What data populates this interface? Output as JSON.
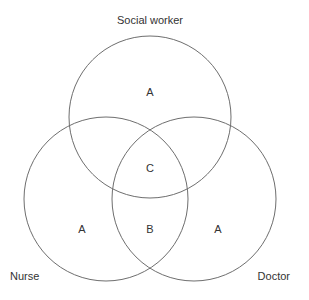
{
  "diagram": {
    "type": "venn",
    "sets": [
      {
        "id": "social_worker",
        "label": "Social worker",
        "cx": 150,
        "cy": 117,
        "r": 81
      },
      {
        "id": "nurse",
        "label": "Nurse",
        "cx": 106,
        "cy": 199,
        "r": 82
      },
      {
        "id": "doctor",
        "label": "Doctor",
        "cx": 194,
        "cy": 199,
        "r": 82
      }
    ],
    "labels": {
      "social_worker": "Social worker",
      "nurse": "Nurse",
      "doctor": "Doctor"
    },
    "regions": {
      "social_worker_only": "A",
      "all_three": "C",
      "nurse_only": "A",
      "nurse_doctor": "B",
      "doctor_only": "A"
    },
    "stroke_color": "#6e6e6e",
    "text_color": "#333333"
  }
}
